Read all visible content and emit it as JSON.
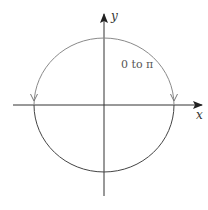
{
  "diagram": {
    "type": "parametric-circle",
    "axes": {
      "x_label": "x",
      "y_label": "y"
    },
    "annotation": "0 to π",
    "colors": {
      "axis": "#333333",
      "upper_arc": "#8a8a8a",
      "lower_arc": "#444444",
      "annotation": "#666666"
    }
  }
}
